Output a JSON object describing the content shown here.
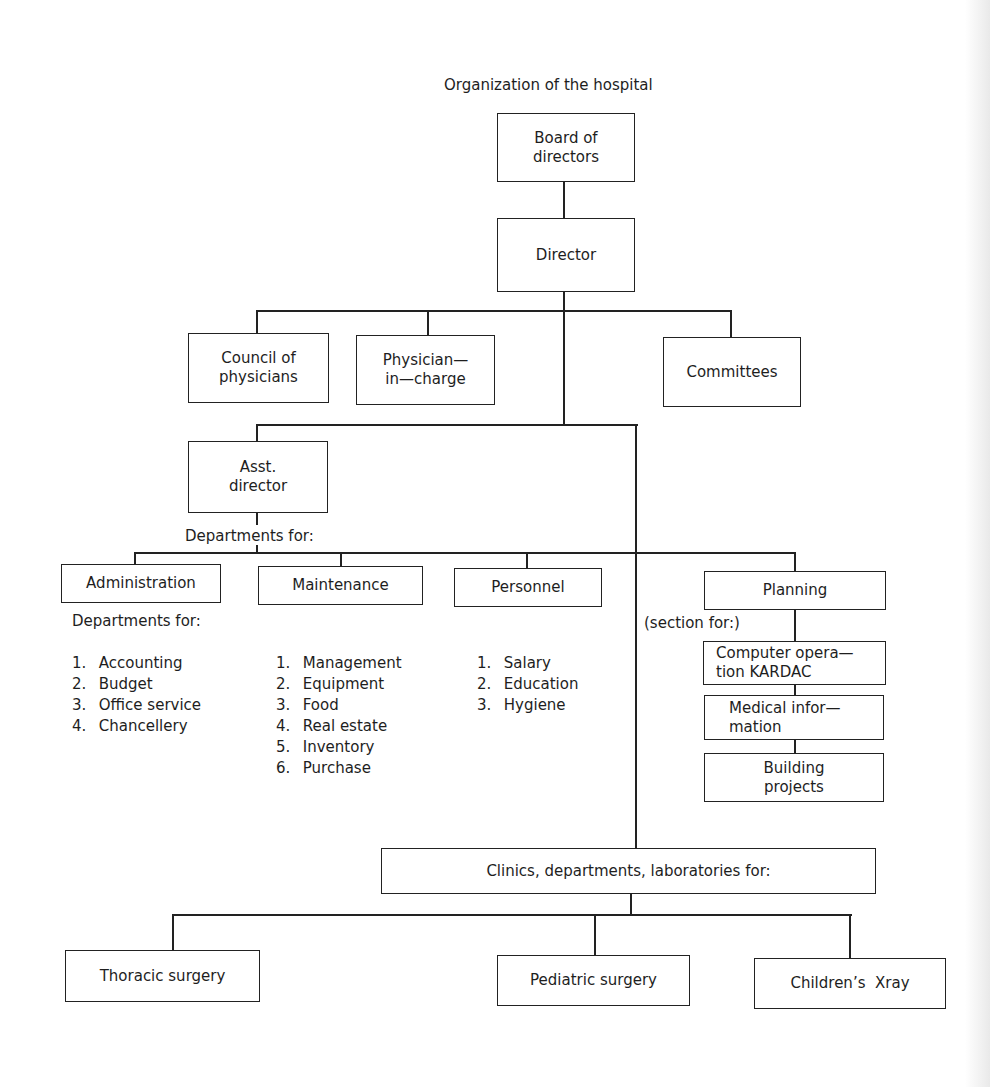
{
  "title": "Organization of the hospital",
  "nodes": {
    "board": "Board of\ndirectors",
    "director": "Director",
    "council": "Council of\nphysicians",
    "physician": "Physician—\nin—charge",
    "committees": "Committees",
    "asst_director": "Asst.\ndirector",
    "administration": "Administration",
    "maintenance": "Maintenance",
    "personnel": "Personnel",
    "planning": "Planning",
    "computer": "Computer opera—\ntion KARDAC",
    "medical": "Medical infor—\nmation",
    "building": "Building\nprojects",
    "clinics": "Clinics, departments, laboratories for:",
    "thoracic": "Thoracic surgery",
    "pediatric": "Pediatric surgery",
    "xray": "Children’s  Xray"
  },
  "labels": {
    "departments_for_asst": "Departments for:",
    "departments_for_admin": "Departments for:",
    "section_for": "(section for:)"
  },
  "lists": {
    "administration": [
      {
        "n": "1.",
        "t": "Accounting"
      },
      {
        "n": "2.",
        "t": "Budget"
      },
      {
        "n": "3.",
        "t": "Office service"
      },
      {
        "n": "4.",
        "t": "Chancellery"
      }
    ],
    "maintenance": [
      {
        "n": "1.",
        "t": "Management"
      },
      {
        "n": "2.",
        "t": "Equipment"
      },
      {
        "n": "3.",
        "t": "Food"
      },
      {
        "n": "4.",
        "t": "Real estate"
      },
      {
        "n": "5.",
        "t": "Inventory"
      },
      {
        "n": "6.",
        "t": "Purchase"
      }
    ],
    "personnel": [
      {
        "n": "1.",
        "t": "Salary"
      },
      {
        "n": "2.",
        "t": "Education"
      },
      {
        "n": "3.",
        "t": "Hygiene"
      }
    ]
  }
}
